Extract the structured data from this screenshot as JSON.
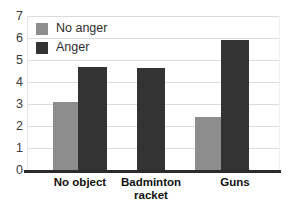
{
  "chart_data": {
    "type": "bar",
    "title": "",
    "subtitle": "",
    "xlabel": "",
    "ylabel": "",
    "categories": [
      "No object",
      "Badminton racket",
      "Guns"
    ],
    "category_lines": [
      [
        "No object"
      ],
      [
        "Badminton",
        "racket"
      ],
      [
        "Guns"
      ]
    ],
    "series": [
      {
        "name": "No anger",
        "color": "#8d8d8d",
        "values": [
          3.1,
          null,
          2.4
        ]
      },
      {
        "name": "Anger",
        "color": "#333333",
        "values": [
          4.7,
          4.65,
          5.9
        ]
      }
    ],
    "ylim": [
      0,
      7
    ],
    "yticks": [
      0,
      1,
      2,
      3,
      4,
      5,
      6,
      7
    ],
    "ytick_labels": [
      "0",
      "1",
      "2",
      "3",
      "4",
      "5",
      "6",
      "7"
    ],
    "grid": true,
    "grid_axis": "y",
    "legend_position": "upper left",
    "legend": [
      {
        "label": "No anger",
        "color": "#8d8d8d"
      },
      {
        "label": "Anger",
        "color": "#333333"
      }
    ],
    "annotations": []
  },
  "colors": {
    "background": "#ffffff",
    "no_anger": "#8d8d8d",
    "anger": "#333333",
    "gridline": "#dcdcdc",
    "axis": "#2b2b2b",
    "tick_text": "#3a3a3a",
    "category_text": "#111111"
  }
}
